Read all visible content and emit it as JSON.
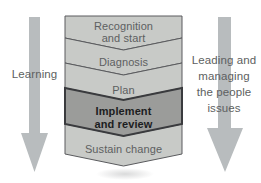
{
  "diagram": {
    "left_arrow": {
      "label": "Learning"
    },
    "right_arrow": {
      "label": "Leading and managing the people issues",
      "lines": [
        "Leading and",
        "managing",
        "the people",
        "issues"
      ]
    },
    "steps": [
      {
        "label": "Recognition and start",
        "lines": [
          "Recognition",
          "and start"
        ],
        "highlighted": false
      },
      {
        "label": "Diagnosis",
        "lines": [
          "Diagnosis"
        ],
        "highlighted": false
      },
      {
        "label": "Plan",
        "lines": [
          "Plan"
        ],
        "highlighted": false
      },
      {
        "label": "Implement and review",
        "lines": [
          "Implement",
          "and review"
        ],
        "highlighted": true
      },
      {
        "label": "Sustain change",
        "lines": [
          "Sustain change"
        ],
        "highlighted": false
      }
    ],
    "colors": {
      "step_fill": "#c8cac7",
      "step_fill_highlight": "#9b9c9a",
      "step_border": "#5a5b5e",
      "step_border_highlight": "#3a3b3e",
      "arrow_fill": "#b8bcbe",
      "text": "#5d5f61",
      "text_highlight": "#1c1d1f",
      "background": "#ffffff"
    }
  }
}
